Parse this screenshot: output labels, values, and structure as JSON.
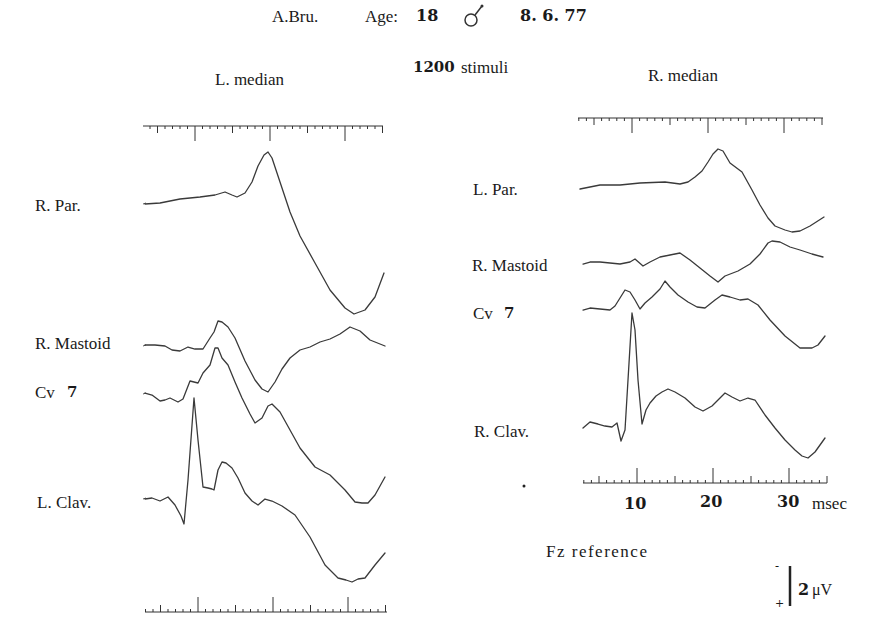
{
  "header": {
    "subject": "A.Bru.",
    "age_label": "Age:",
    "age_value": "18",
    "sex_symbol": "♂",
    "date": "8. 6. 77",
    "stimuli_count": "1200",
    "stimuli_label": "stimuli"
  },
  "left_panel": {
    "title": "L. median",
    "labels": [
      "R. Par.",
      "R. Mastoid",
      "Cv",
      "L. Clav."
    ],
    "cv_number": "7"
  },
  "right_panel": {
    "title": "R. median",
    "labels": [
      "L. Par.",
      "R. Mastoid",
      "Cv",
      "R. Clav."
    ],
    "cv_number": "7"
  },
  "axis": {
    "ticks": [
      "10",
      "20",
      "30"
    ],
    "unit": "msec"
  },
  "reference": "Fz reference",
  "calibration": {
    "value": "2",
    "unit": "μV",
    "minus": "-",
    "plus": "+"
  },
  "colors": {
    "trace": "#3a3a3a",
    "text": "#1a1a1a",
    "background": "#ffffff"
  },
  "chart_data": [
    {
      "type": "line",
      "title": "L. median",
      "xlabel": "msec",
      "ylabel": "μV (negative up)",
      "x_range_ms": [
        3,
        35
      ],
      "calibration_uV": 2,
      "reference": "Fz",
      "grid": false,
      "series": [
        {
          "name": "R. Par.",
          "x_px": [
            145,
            160,
            180,
            200,
            215,
            225,
            232,
            237,
            245,
            252,
            258,
            264,
            268,
            272,
            280,
            290,
            300,
            315,
            330,
            345,
            354,
            365,
            375,
            384
          ],
          "y_px": [
            204,
            203,
            199,
            197,
            195,
            192,
            195,
            197,
            193,
            182,
            166,
            155,
            152,
            158,
            182,
            212,
            236,
            263,
            290,
            308,
            314,
            310,
            297,
            273
          ]
        },
        {
          "name": "R. Mastoid",
          "x_px": [
            145,
            155,
            165,
            172,
            180,
            188,
            195,
            203,
            210,
            214,
            218,
            222,
            228,
            235,
            245,
            255,
            262,
            268,
            275,
            282,
            290,
            300,
            310,
            320,
            330,
            340,
            350,
            360,
            370,
            385
          ],
          "y_px": [
            345,
            345,
            346,
            350,
            351,
            347,
            349,
            349,
            338,
            332,
            321,
            322,
            327,
            338,
            361,
            380,
            389,
            392,
            382,
            369,
            358,
            350,
            347,
            342,
            339,
            334,
            327,
            331,
            340,
            346
          ]
        },
        {
          "name": "Cv 7",
          "x_px": [
            145,
            152,
            160,
            165,
            170,
            178,
            183,
            190,
            198,
            203,
            210,
            215,
            218,
            222,
            228,
            235,
            242,
            250,
            255,
            262,
            268,
            272,
            280,
            290,
            300,
            315,
            330,
            345,
            355,
            362,
            368,
            375,
            385
          ],
          "y_px": [
            393,
            395,
            401,
            400,
            398,
            402,
            399,
            381,
            383,
            373,
            365,
            348,
            348,
            358,
            365,
            382,
            398,
            414,
            423,
            418,
            406,
            404,
            412,
            430,
            448,
            467,
            475,
            490,
            502,
            503,
            503,
            495,
            477
          ]
        },
        {
          "name": "L. Clav.",
          "x_px": [
            145,
            152,
            160,
            168,
            175,
            181,
            184,
            188,
            194,
            198,
            203,
            208,
            212,
            214,
            218,
            222,
            226,
            232,
            238,
            245,
            252,
            258,
            265,
            272,
            282,
            295,
            310,
            325,
            338,
            346,
            352,
            358,
            365,
            375,
            385
          ],
          "y_px": [
            499,
            498,
            501,
            497,
            505,
            516,
            524,
            480,
            398,
            440,
            487,
            488,
            489,
            490,
            470,
            462,
            463,
            468,
            478,
            493,
            501,
            505,
            499,
            501,
            506,
            515,
            537,
            565,
            578,
            580,
            582,
            579,
            578,
            565,
            553
          ]
        }
      ]
    },
    {
      "type": "line",
      "title": "R. median",
      "xlabel": "msec",
      "ylabel": "μV (negative up)",
      "x_ticks": [
        10,
        20,
        30
      ],
      "x_range_ms": [
        3,
        35
      ],
      "calibration_uV": 2,
      "reference": "Fz",
      "grid": false,
      "series": [
        {
          "name": "L. Par.",
          "x_px": [
            580,
            590,
            600,
            620,
            640,
            665,
            680,
            688,
            695,
            702,
            708,
            713,
            718,
            723,
            730,
            742,
            752,
            760,
            768,
            775,
            785,
            792,
            800,
            810,
            824
          ],
          "y_px": [
            189,
            187,
            185,
            185,
            183,
            182,
            184,
            182,
            177,
            171,
            162,
            154,
            149,
            151,
            163,
            172,
            190,
            205,
            218,
            226,
            230,
            232,
            231,
            226,
            217
          ]
        },
        {
          "name": "R. Mastoid",
          "x_px": [
            583,
            590,
            600,
            610,
            620,
            630,
            635,
            643,
            650,
            660,
            670,
            680,
            690,
            700,
            710,
            718,
            725,
            738,
            750,
            760,
            768,
            772,
            780,
            790,
            800,
            812,
            823
          ],
          "y_px": [
            264,
            262,
            262,
            263,
            264,
            262,
            259,
            266,
            262,
            257,
            255,
            253,
            260,
            268,
            276,
            282,
            276,
            271,
            264,
            254,
            243,
            241,
            242,
            247,
            250,
            254,
            257
          ]
        },
        {
          "name": "Cv 7",
          "x_px": [
            583,
            590,
            600,
            610,
            615,
            620,
            625,
            630,
            635,
            640,
            645,
            652,
            660,
            665,
            670,
            678,
            688,
            697,
            705,
            715,
            722,
            730,
            740,
            748,
            758,
            770,
            785,
            800,
            812,
            818,
            825
          ],
          "y_px": [
            310,
            308,
            309,
            310,
            306,
            298,
            290,
            292,
            300,
            309,
            303,
            297,
            289,
            281,
            287,
            295,
            302,
            307,
            308,
            300,
            295,
            297,
            300,
            299,
            305,
            320,
            336,
            348,
            348,
            345,
            336
          ]
        },
        {
          "name": "R. Clav.",
          "x_px": [
            583,
            590,
            598,
            605,
            612,
            617,
            621,
            625,
            628,
            632,
            635,
            638,
            642,
            646,
            650,
            656,
            662,
            668,
            675,
            685,
            695,
            703,
            712,
            720,
            725,
            732,
            740,
            748,
            755,
            765,
            775,
            785,
            795,
            802,
            808,
            815,
            825
          ],
          "y_px": [
            428,
            422,
            424,
            426,
            427,
            423,
            441,
            430,
            380,
            313,
            330,
            380,
            424,
            410,
            403,
            396,
            392,
            389,
            392,
            398,
            407,
            411,
            406,
            398,
            393,
            397,
            401,
            398,
            400,
            415,
            428,
            440,
            450,
            456,
            458,
            452,
            438
          ]
        }
      ]
    }
  ]
}
